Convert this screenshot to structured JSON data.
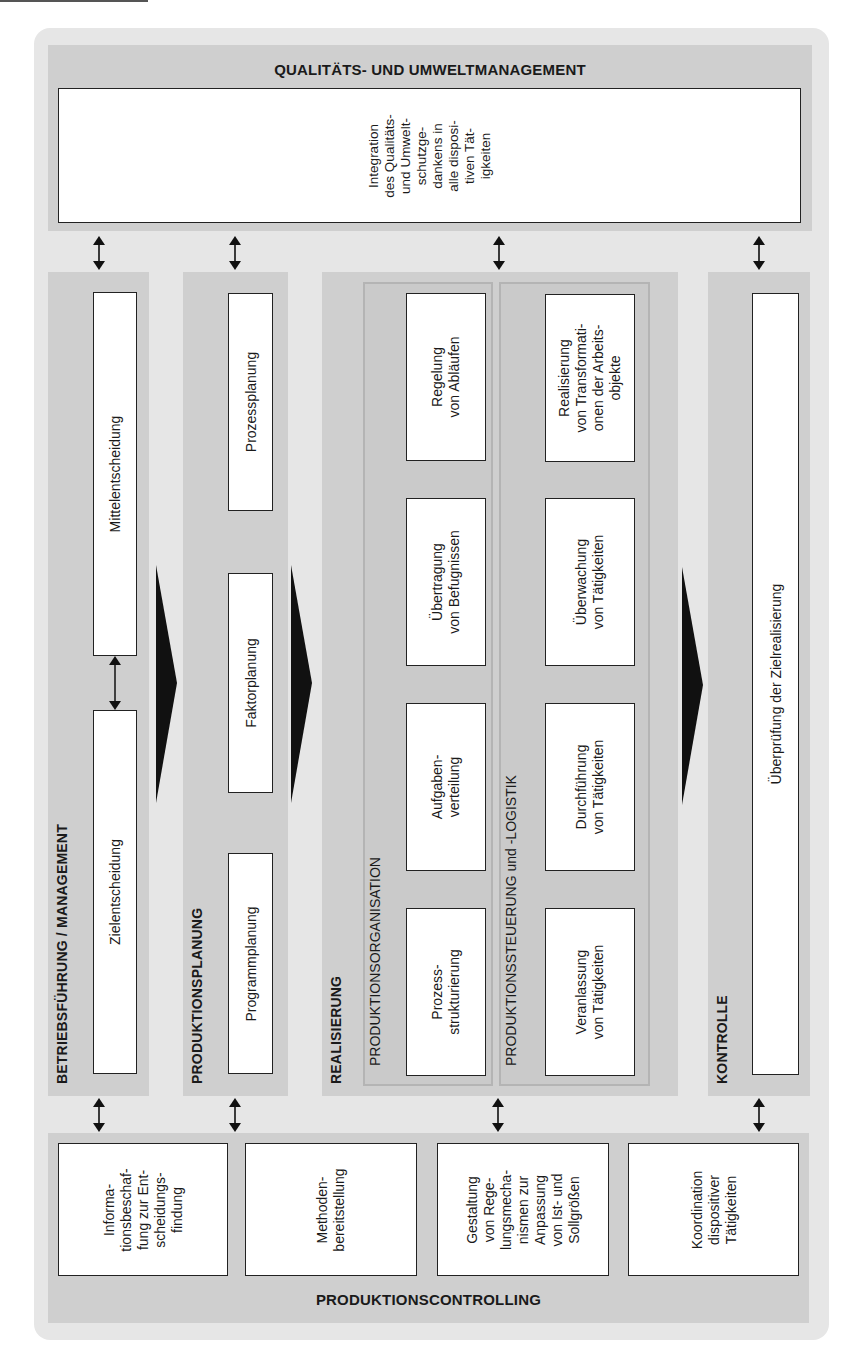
{
  "diagram": {
    "top": {
      "title": "QUALITÄTS- UND UMWELTMANAGEMENT",
      "box": "Integration\ndes Qualitäts-\nund Umwelt-\nschutzge-\ndankens in\nalle disposi-\ntiven Tät-\nigkeiten"
    },
    "columns": {
      "management": {
        "title": "BETRIEBSFÜHRUNG / MANAGEMENT",
        "boxes": [
          "Mittelentscheidung",
          "Zielentscheidung"
        ]
      },
      "planning": {
        "title": "PRODUKTIONSPLANUNG",
        "boxes": [
          "Prozessplanung",
          "Faktorplanung",
          "Programmplanung"
        ]
      },
      "realization": {
        "title": "REALISIERUNG",
        "organisation": {
          "title": "PRODUKTIONSORGANISATION",
          "boxes": [
            "Regelung\nvon Abläufen",
            "Übertragung\nvon Befugnissen",
            "Aufgaben-\nverteilung",
            "Prozess-\nstrukturierung"
          ]
        },
        "control": {
          "title": "PRODUKTIONSSTEUERUNG und -LOGISTIK",
          "boxes": [
            "Realisierung\nvon Transformati-\nonen der Arbeits-\nobjekte",
            "Überwachung\nvon Tätigkeiten",
            "Durchführung\nvon Tätigkeiten",
            "Veranlassung\nvon Tätigkeiten"
          ]
        }
      },
      "kontrolle": {
        "title": "KONTROLLE",
        "box": "Überprüfung der Zielrealisierung"
      }
    },
    "bottom": {
      "title": "PRODUKTIONSCONTROLLING",
      "boxes": [
        "Informa-\ntionsbeschaf-\nfung zur Ent-\nscheidungs-\nfindung",
        "Methoden-\nbereitstellung",
        "Gestaltung\nvon Rege-\nlungsmecha-\nnismen zur\nAnpassung\nvon Ist- und\nSollgrößen",
        "Koordination\ndispositiver\nTätigkeiten"
      ]
    },
    "colors": {
      "background": "#e6e6e6",
      "band": "#cfcfcf",
      "box": "#ffffff",
      "arrow": "#111111"
    }
  }
}
